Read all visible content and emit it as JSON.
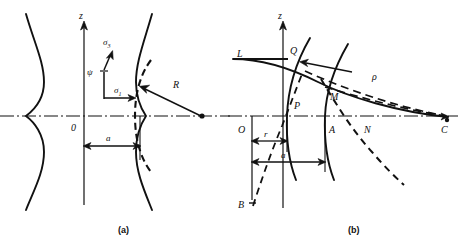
{
  "figure": {
    "background": "#ffffff",
    "ink": "#111111",
    "width": 461,
    "height": 239
  },
  "panels": [
    {
      "id": "a",
      "caption": "(a)",
      "caption_pos": {
        "x": 122,
        "y": 232
      },
      "axes": {
        "z_label": "z",
        "z_label_pos": {
          "x": 79,
          "y": 18
        },
        "origin_label": "0",
        "origin_label_pos": {
          "x": 72,
          "y": 129
        },
        "z_axis": {
          "x": 84,
          "y_top": 22,
          "y_bottom": 205
        },
        "r_axis": {
          "y": 116,
          "x_left": 0,
          "x_right": 230
        }
      },
      "labels": [
        {
          "name": "sigma-3-label",
          "text": "σ",
          "sub": "3",
          "x": 106,
          "y": 44,
          "italic": true
        },
        {
          "name": "sigma-1-label",
          "text": "σ",
          "sub": "1",
          "x": 116,
          "y": 90,
          "italic": true
        },
        {
          "name": "psi-label",
          "text": "ψ",
          "x": 89,
          "y": 72,
          "italic": true
        },
        {
          "name": "radius-label",
          "text": "R",
          "x": 175,
          "y": 86,
          "italic": true
        },
        {
          "name": "neck-radius-label",
          "text": "a",
          "x": 108,
          "y": 133,
          "italic": true
        }
      ],
      "geometry": {
        "neck_left_profile": "M 26,14 C 34,42 44,62 44,82 C 44,100 34,110 26,116 C 34,122 44,134 44,152 C 44,172 34,190 26,210",
        "neck_right_profile": "M 152,14 C 144,42 136,62 136,82 C 136,100 142,110 146,116 C 142,122 136,134 136,152 C 136,172 144,190 152,210",
        "curvature_arc_dashed": "M 150,62 C 138,76 134,96 134,116 C 134,136 138,156 150,170",
        "radius_arrow": {
          "from": {
            "x": 203,
            "y": 116
          },
          "to": {
            "x": 141,
            "y": 88
          }
        },
        "curvature_center": {
          "x": 203,
          "y": 116
        },
        "dim_a": {
          "y": 146,
          "x_left": 84,
          "x_right": 140
        },
        "dim_tick_left": {
          "x": 84,
          "y_top": 116,
          "y_bottom": 205
        },
        "dim_tick_right": {
          "x": 140,
          "y_top": 116,
          "y_bottom": 160
        },
        "sigma1_arrow": {
          "from": {
            "x": 104,
            "y": 98
          },
          "to": {
            "x": 134,
            "y": 98
          }
        },
        "sigma1_stem": {
          "from": {
            "x": 104,
            "y": 98
          },
          "to": {
            "x": 104,
            "y": 70
          }
        },
        "sigma3_arrow": {
          "from": {
            "x": 104,
            "y": 72
          },
          "to": {
            "x": 112,
            "y": 52
          }
        }
      }
    },
    {
      "id": "b",
      "caption": "(b)",
      "caption_pos": {
        "x": 352,
        "y": 232
      },
      "axes": {
        "z_label": "z",
        "z_label_pos": {
          "x": 277,
          "y": 18
        },
        "origin_label": "O",
        "origin_label_pos": {
          "x": 240,
          "y": 130
        },
        "z_axis": {
          "x": 283,
          "y_top": 22,
          "y_bottom": 208
        },
        "r_axis": {
          "y": 116,
          "x_left": 228,
          "x_right": 456
        }
      },
      "labels": [
        {
          "name": "point-L-label",
          "text": "L",
          "x": 240,
          "y": 57,
          "italic": true
        },
        {
          "name": "point-Q-label",
          "text": "Q",
          "x": 292,
          "y": 55,
          "italic": true
        },
        {
          "name": "point-P-label",
          "text": "P",
          "x": 296,
          "y": 106,
          "italic": true
        },
        {
          "name": "point-M-label",
          "text": "M",
          "x": 333,
          "y": 97,
          "italic": true
        },
        {
          "name": "point-A-label",
          "text": "A",
          "x": 331,
          "y": 131,
          "italic": true
        },
        {
          "name": "point-N-label",
          "text": "N",
          "x": 366,
          "y": 131,
          "italic": true
        },
        {
          "name": "point-C-label",
          "text": "C",
          "x": 443,
          "y": 131,
          "italic": true
        },
        {
          "name": "point-B-label",
          "text": "B",
          "x": 240,
          "y": 206,
          "italic": true
        },
        {
          "name": "rho-label",
          "text": "ρ",
          "x": 374,
          "y": 77,
          "italic": true
        },
        {
          "name": "radius-r-label",
          "text": "r",
          "x": 265,
          "y": 145,
          "italic": true
        },
        {
          "name": "radius-a-label",
          "text": "a",
          "x": 282,
          "y": 166,
          "italic": true
        }
      ],
      "geometry": {
        "curve_LC_solid": "M 233,59 C 262,59 290,68 318,82 C 348,97 398,112 448,116",
        "curve_QP_solid": "M 310,38 C 296,62 288,88 287,116 C 286,142 289,162 296,180",
        "curve_MA_solid": "M 348,44 C 334,68 326,92 325,116 C 324,142 327,162 334,180",
        "dashed_BQ": "M 253,206 C 262,178 272,150 282,126 C 290,106 296,90 302,74",
        "dashed_QC": "M 304,72 C 340,88 396,106 446,116",
        "dashed_MC": "M 326,88 C 362,98 406,110 446,116",
        "dashed_MN_arc": "M 322,80 C 336,104 352,130 372,152 C 384,166 394,176 404,184",
        "dashed_axis": "M 228,116 L 456,116",
        "arrow_to_Q": {
          "from": {
            "x": 352,
            "y": 72
          },
          "to": {
            "x": 300,
            "y": 63
          }
        },
        "arrow_to_C": {
          "from": {
            "x": 420,
            "y": 112
          },
          "to": {
            "x": 447,
            "y": 117
          }
        },
        "dim_r": {
          "y": 141,
          "x_left": 252,
          "x_right": 287
        },
        "dim_a": {
          "y": 162,
          "x_left": 252,
          "x_right": 325
        },
        "dim_tick_O": {
          "x": 252,
          "y_top": 116,
          "y_bottom": 200
        },
        "dim_tick_P": {
          "x": 287,
          "y_top": 120,
          "y_bottom": 152
        },
        "dim_tick_A": {
          "x": 325,
          "y_top": 120,
          "y_bottom": 172
        },
        "line_L_tick": {
          "from": {
            "x": 233,
            "y": 59
          },
          "to": {
            "x": 283,
            "y": 59
          }
        }
      }
    }
  ]
}
